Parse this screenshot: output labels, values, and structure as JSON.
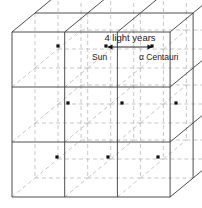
{
  "diagram": {
    "type": "3d-lattice",
    "grid": {
      "columns": 3,
      "rows": 3,
      "layers": 3
    },
    "colors": {
      "solid_line": "#3a3a3a",
      "dashed_line": "#b9b9b9",
      "star_dot": "#111111",
      "text": "#1a1a1a",
      "background": "#ffffff"
    },
    "geometry": {
      "front_left_x": 12,
      "front_right_x": 170,
      "front_top_y": 32,
      "front_bottom_y": 197,
      "cell_width": 52.7,
      "cell_height": 55,
      "depth_dx": 23,
      "depth_dy": -19
    },
    "labels": {
      "distance": "4 light years",
      "sun": "Sun",
      "alpha_centauri": "α Centauri"
    },
    "annotation": {
      "arrow_left_x": 108,
      "arrow_right_x": 152,
      "arrow_y": 47,
      "double_headed": true
    },
    "stars": [
      {
        "name": "star-r0-c0",
        "x": 58,
        "y": 46
      },
      {
        "name": "star-sun",
        "x": 106,
        "y": 46
      },
      {
        "name": "star-alpha-centauri",
        "x": 152,
        "y": 46
      },
      {
        "name": "star-r1-c0",
        "x": 68,
        "y": 103
      },
      {
        "name": "star-r1-c1",
        "x": 122,
        "y": 103
      },
      {
        "name": "star-r1-c2",
        "x": 176,
        "y": 103
      },
      {
        "name": "star-r2-c0",
        "x": 57,
        "y": 157
      },
      {
        "name": "star-r2-c1",
        "x": 108,
        "y": 157
      },
      {
        "name": "star-r2-c2",
        "x": 158,
        "y": 157
      }
    ]
  }
}
